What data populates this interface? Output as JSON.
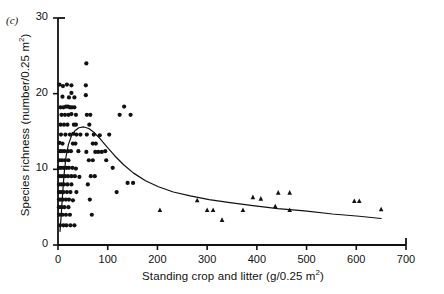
{
  "panel": {
    "letter": "(c)"
  },
  "chart_data": {
    "type": "scatter",
    "title": "",
    "panel_label": "(c)",
    "xlabel": "Standing crop and litter (g/0.25 m2)",
    "ylabel": "Species richness (number/0.25 m2)",
    "xlim": [
      0,
      700
    ],
    "ylim": [
      0,
      30
    ],
    "xticks": [
      0,
      100,
      200,
      300,
      400,
      500,
      600,
      700
    ],
    "yticks": [
      0,
      10,
      20,
      30
    ],
    "xtick_labels": [
      "0",
      "100",
      "200",
      "300",
      "400",
      "500",
      "600",
      "700"
    ],
    "ytick_labels": [
      "0",
      "10",
      "20",
      "30"
    ],
    "grid": false,
    "legend": "none",
    "series": [
      {
        "name": "circles",
        "marker": "circle",
        "points": [
          [
            3,
            21.2
          ],
          [
            10,
            21.0
          ],
          [
            18,
            21.2
          ],
          [
            27,
            21.1
          ],
          [
            27,
            20.1
          ],
          [
            9,
            19.6
          ],
          [
            22,
            19.5
          ],
          [
            33,
            19.5
          ],
          [
            5,
            18.2
          ],
          [
            11,
            18.2
          ],
          [
            16,
            18.3
          ],
          [
            20,
            18.3
          ],
          [
            24,
            18.2
          ],
          [
            28,
            18.2
          ],
          [
            33,
            18.2
          ],
          [
            7,
            17.2
          ],
          [
            14,
            17.2
          ],
          [
            21,
            17.2
          ],
          [
            27,
            17.3
          ],
          [
            36,
            17.2
          ],
          [
            5,
            15.9
          ],
          [
            12,
            15.9
          ],
          [
            19,
            15.9
          ],
          [
            32,
            15.9
          ],
          [
            36,
            15.9
          ],
          [
            6,
            14.6
          ],
          [
            15,
            14.6
          ],
          [
            24,
            14.6
          ],
          [
            31,
            14.7
          ],
          [
            37,
            14.6
          ],
          [
            45,
            14.6
          ],
          [
            58,
            14.6
          ],
          [
            3,
            13.5
          ],
          [
            9,
            13.4
          ],
          [
            30,
            13.4
          ],
          [
            35,
            13.4
          ],
          [
            4,
            12.4
          ],
          [
            8,
            12.4
          ],
          [
            13,
            12.4
          ],
          [
            20,
            12.4
          ],
          [
            26,
            12.4
          ],
          [
            41,
            12.4
          ],
          [
            57,
            12.3
          ],
          [
            3,
            11.2
          ],
          [
            8,
            11.2
          ],
          [
            14,
            11.2
          ],
          [
            21,
            11.2
          ],
          [
            2,
            10.2
          ],
          [
            6,
            10.2
          ],
          [
            11,
            10.2
          ],
          [
            17,
            10.2
          ],
          [
            22,
            10.2
          ],
          [
            29,
            10.2
          ],
          [
            36,
            10.1
          ],
          [
            3,
            9.1
          ],
          [
            8,
            9.1
          ],
          [
            14,
            9.1
          ],
          [
            20,
            9.1
          ],
          [
            27,
            9.1
          ],
          [
            34,
            9.1
          ],
          [
            43,
            9.0
          ],
          [
            2,
            8.0
          ],
          [
            7,
            8.0
          ],
          [
            12,
            8.0
          ],
          [
            19,
            8.0
          ],
          [
            27,
            8.0
          ],
          [
            2,
            7.0
          ],
          [
            6,
            7.0
          ],
          [
            11,
            7.0
          ],
          [
            18,
            7.0
          ],
          [
            25,
            7.0
          ],
          [
            37,
            7.0
          ],
          [
            2,
            6.0
          ],
          [
            6,
            6.0
          ],
          [
            10,
            6.0
          ],
          [
            16,
            6.0
          ],
          [
            22,
            6.0
          ],
          [
            30,
            5.9
          ],
          [
            2,
            5.0
          ],
          [
            7,
            5.0
          ],
          [
            13,
            5.0
          ],
          [
            21,
            5.0
          ],
          [
            3,
            4.0
          ],
          [
            9,
            4.0
          ],
          [
            16,
            4.0
          ],
          [
            24,
            4.0
          ],
          [
            4,
            2.6
          ],
          [
            11,
            2.6
          ],
          [
            17,
            2.6
          ],
          [
            25,
            2.6
          ],
          [
            33,
            2.6
          ],
          [
            57,
            24.0
          ],
          [
            56,
            21.1
          ],
          [
            56,
            19.8
          ],
          [
            58,
            17.2
          ],
          [
            65,
            17.2
          ],
          [
            63,
            15.9
          ],
          [
            72,
            14.6
          ],
          [
            84,
            14.5
          ],
          [
            70,
            13.4
          ],
          [
            76,
            13.4
          ],
          [
            75,
            12.3
          ],
          [
            81,
            12.3
          ],
          [
            88,
            12.3
          ],
          [
            62,
            11.2
          ],
          [
            70,
            11.2
          ],
          [
            66,
            9.1
          ],
          [
            74,
            9.1
          ],
          [
            60,
            8.0
          ],
          [
            64,
            6.0
          ],
          [
            68,
            4.0
          ],
          [
            95,
            12.4
          ],
          [
            97,
            11.2
          ],
          [
            103,
            14.6
          ],
          [
            110,
            10.2
          ],
          [
            118,
            7.0
          ],
          [
            124,
            17.2
          ],
          [
            133,
            18.3
          ],
          [
            140,
            8.2
          ],
          [
            151,
            8.2
          ],
          [
            146,
            17.2
          ]
        ]
      },
      {
        "name": "triangles",
        "marker": "triangle",
        "points": [
          [
            205,
            4.6
          ],
          [
            280,
            5.9
          ],
          [
            300,
            4.6
          ],
          [
            312,
            4.6
          ],
          [
            330,
            3.3
          ],
          [
            372,
            4.6
          ],
          [
            392,
            6.3
          ],
          [
            408,
            6.1
          ],
          [
            437,
            5.1
          ],
          [
            443,
            6.9
          ],
          [
            466,
            6.9
          ],
          [
            466,
            4.6
          ],
          [
            596,
            5.8
          ],
          [
            606,
            5.8
          ],
          [
            650,
            4.7
          ]
        ]
      }
    ],
    "fit_curve": {
      "name": "fitted hump-shaped curve",
      "points": [
        [
          4,
          1.8
        ],
        [
          6,
          3.5
        ],
        [
          9,
          6.5
        ],
        [
          12,
          9.2
        ],
        [
          16,
          11.6
        ],
        [
          21,
          13.3
        ],
        [
          27,
          14.4
        ],
        [
          34,
          15.1
        ],
        [
          42,
          15.5
        ],
        [
          52,
          15.6
        ],
        [
          62,
          15.4
        ],
        [
          72,
          14.9
        ],
        [
          84,
          14.1
        ],
        [
          98,
          13.0
        ],
        [
          114,
          11.8
        ],
        [
          132,
          10.6
        ],
        [
          152,
          9.5
        ],
        [
          176,
          8.5
        ],
        [
          202,
          7.7
        ],
        [
          232,
          7.0
        ],
        [
          266,
          6.5
        ],
        [
          304,
          6.0
        ],
        [
          346,
          5.6
        ],
        [
          392,
          5.2
        ],
        [
          442,
          4.8
        ],
        [
          496,
          4.5
        ],
        [
          552,
          4.1
        ],
        [
          606,
          3.8
        ],
        [
          650,
          3.5
        ]
      ]
    }
  }
}
